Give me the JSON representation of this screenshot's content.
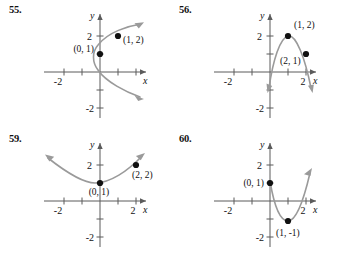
{
  "page": {
    "kind": "textbook-exercise-figures",
    "background_color": "#ffffff",
    "curve_color": "#9a9a9a",
    "axis_color": "#5b5b5b",
    "ink_color": "#111111"
  },
  "panels": [
    {
      "number": "55.",
      "axis": {
        "x_label": "x",
        "y_label": "y",
        "x_ticklabels": [
          "-2"
        ],
        "y_ticklabels": [
          "2",
          "-2"
        ],
        "xlim": [
          -3.2,
          2.6
        ],
        "ylim": [
          -2.6,
          2.8
        ],
        "grid": false
      },
      "points": [
        {
          "label": "(0, 1)",
          "x": 0,
          "y": 1
        },
        {
          "label": "(1, 2)",
          "x": 1,
          "y": 2
        }
      ],
      "curve": {
        "type": "sideways-parabola-opening-right",
        "vertex": [
          -0.35,
          1.0
        ],
        "arrow_ends": [
          "upper-right",
          "lower-right"
        ]
      }
    },
    {
      "number": "56.",
      "axis": {
        "x_label": "x",
        "y_label": "y",
        "x_ticklabels": [
          "-2",
          "2"
        ],
        "y_ticklabels": [
          "2",
          "-2"
        ],
        "xlim": [
          -3.2,
          2.6
        ],
        "ylim": [
          -2.6,
          2.8
        ],
        "grid": false
      },
      "points": [
        {
          "label": "(1, 2)",
          "x": 1,
          "y": 2
        },
        {
          "label": "(2, 1)",
          "x": 2,
          "y": 1
        }
      ],
      "curve": {
        "type": "parabola-opening-down",
        "vertex": [
          1.0,
          2.1
        ],
        "arrow_ends": [
          "lower-left",
          "lower-right"
        ]
      }
    },
    {
      "number": "59.",
      "axis": {
        "x_label": "x",
        "y_label": "y",
        "x_ticklabels": [
          "-2",
          "2"
        ],
        "y_ticklabels": [
          "2",
          "-2"
        ],
        "xlim": [
          -3.2,
          2.8
        ],
        "ylim": [
          -2.6,
          2.8
        ],
        "grid": false
      },
      "points": [
        {
          "label": "(0, 1)",
          "x": 0,
          "y": 1
        },
        {
          "label": "(2, 2)",
          "x": 2,
          "y": 2
        }
      ],
      "curve": {
        "type": "parabola-opening-up",
        "vertex": [
          -0.3,
          0.92
        ],
        "arrow_ends": [
          "upper-left",
          "upper-right"
        ]
      }
    },
    {
      "number": "60.",
      "axis": {
        "x_label": "x",
        "y_label": "y",
        "x_ticklabels": [
          "-2",
          "2"
        ],
        "y_ticklabels": [
          "2",
          "-2"
        ],
        "xlim": [
          -3.2,
          2.6
        ],
        "ylim": [
          -2.6,
          2.8
        ],
        "grid": false
      },
      "points": [
        {
          "label": "(0, 1)",
          "x": 0,
          "y": 1
        },
        {
          "label": "(1, -1)",
          "x": 1,
          "y": -1
        }
      ],
      "curve": {
        "type": "parabola-opening-up",
        "vertex": [
          1.0,
          -1.1
        ],
        "arrow_ends": [
          "upper-left",
          "upper-right"
        ]
      }
    }
  ]
}
